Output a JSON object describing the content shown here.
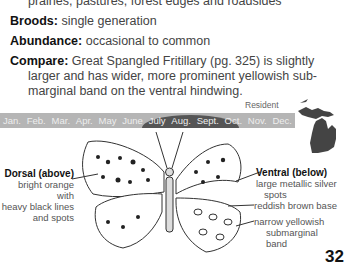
{
  "text": {
    "habitat_cont": "prairies, pastures, forest edges and roadsides",
    "broods": {
      "label": "Broods:",
      "value": "single generation"
    },
    "abundance": {
      "label": "Abundance:",
      "value": "occasional to common"
    },
    "compare": {
      "label": "Compare:",
      "line1": "Great Spangled Fritillary (pg. 325) is slightly",
      "line2": "larger and has wider, more prominent yellowish sub-",
      "line3": "marginal band on the ventral hindwing."
    }
  },
  "flight_chart": {
    "status": "Resident",
    "months": [
      "Jan.",
      "Feb.",
      "Mar.",
      "Apr.",
      "May",
      "June",
      "July",
      "Aug.",
      "Sept.",
      "Oct.",
      "Nov.",
      "Dec."
    ],
    "peak_months": [
      "July",
      "Aug.",
      "Sept."
    ]
  },
  "range_map": {
    "region": "Michigan",
    "color": "#444444"
  },
  "illustration": {
    "dorsal": {
      "title": "Dorsal (above)",
      "lines": [
        "bright orange with",
        "heavy black lines",
        "and spots"
      ]
    },
    "ventral": {
      "title": "Ventral (below)",
      "lines": [
        "large metallic silver",
        "spots"
      ]
    },
    "ventral_notes": [
      "reddish brown base",
      "narrow yellowish",
      "submarginal band"
    ]
  },
  "page_number": "32"
}
